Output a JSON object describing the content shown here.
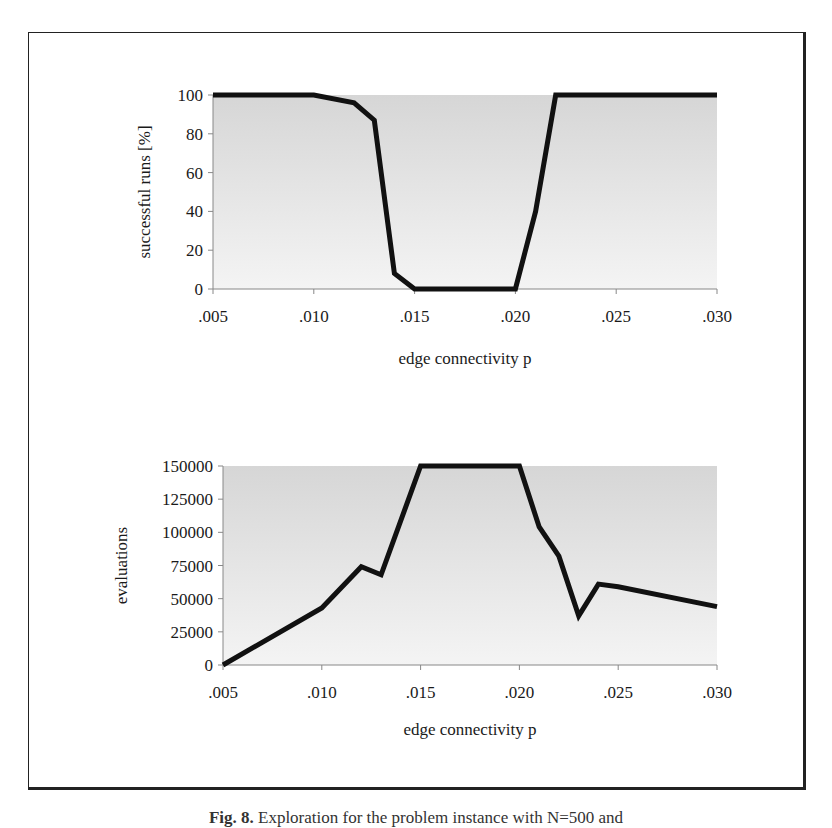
{
  "figure": {
    "caption_label": "Fig. 8.",
    "caption_text": "Exploration for the problem instance with N=500 and"
  },
  "chart_data": [
    {
      "type": "line",
      "title": "",
      "xlabel": "edge connectivity p",
      "ylabel": "successful runs [%]",
      "x": [
        0.005,
        0.01,
        0.012,
        0.013,
        0.014,
        0.015,
        0.02,
        0.021,
        0.022,
        0.03
      ],
      "series": [
        {
          "name": "successful runs",
          "values": [
            100,
            100,
            96,
            87,
            8,
            0,
            0,
            40,
            100,
            100
          ]
        }
      ],
      "xlim": [
        0.005,
        0.03
      ],
      "ylim": [
        0,
        100
      ],
      "xticks": [
        ".005",
        ".010",
        ".015",
        ".020",
        ".025",
        ".030"
      ],
      "yticks": [
        "0",
        "20",
        "40",
        "60",
        "80",
        "100"
      ],
      "grid": false,
      "legend": "none",
      "background": "gradient gray (darker top, lighter bottom)",
      "line_color": "#111111"
    },
    {
      "type": "line",
      "title": "",
      "xlabel": "edge connectivity p",
      "ylabel": "evaluations",
      "x": [
        0.005,
        0.01,
        0.012,
        0.013,
        0.015,
        0.02,
        0.021,
        0.022,
        0.023,
        0.024,
        0.025,
        0.03
      ],
      "series": [
        {
          "name": "evaluations",
          "values": [
            0,
            43000,
            74000,
            68000,
            150000,
            150000,
            104000,
            82000,
            37000,
            61000,
            59000,
            44000
          ]
        }
      ],
      "xlim": [
        0.005,
        0.03
      ],
      "ylim": [
        0,
        150000
      ],
      "xticks": [
        ".005",
        ".010",
        ".015",
        ".020",
        ".025",
        ".030"
      ],
      "yticks": [
        "0",
        "25000",
        "50000",
        "75000",
        "100000",
        "125000",
        "150000"
      ],
      "grid": false,
      "legend": "none",
      "background": "gradient gray (darker top, lighter bottom)",
      "line_color": "#111111"
    }
  ]
}
